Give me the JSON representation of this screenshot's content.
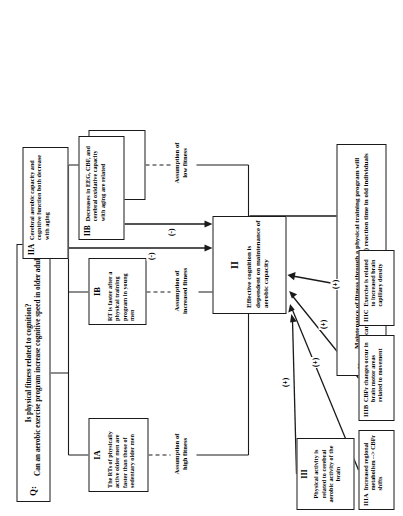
{
  "diagram": {
    "type": "flowchart",
    "orientation": "rotated-90-ccw",
    "title_box": {
      "id": "Q:",
      "text": "Is physical fitness related to cognition?\nCan an aerobic exercise program increase cognitive speed in older adults?"
    },
    "evidence_level_1": [
      {
        "id": "IA",
        "text": "The RTs of physically active older men are faster than those of sedentary older men",
        "assumption": "Assumption of\nhigh fitness"
      },
      {
        "id": "IB",
        "text": "RT is faster after a physical training program in young men",
        "assumption": "Assumption of\nincreased fitness"
      },
      {
        "id": "IC",
        "text": "Persons with CVD have slower RTs",
        "assumption": "Assumption of\nlow fitness"
      }
    ],
    "central_claim": {
      "id": "II",
      "text": "Effective cognition is dependent on maintenance of aerobic capacity"
    },
    "negative_inputs": [
      {
        "id": "IIA",
        "text": "Cerebral aerobic capacity and cognitive function both decrease with aging",
        "sign": "(-)"
      },
      {
        "id": "IIB",
        "text": "Decreases in EEG, CBF, and cerebral oxidative capacity with aging are related",
        "sign": "(-)"
      }
    ],
    "positive_inputs": [
      {
        "id": "III",
        "text": "Physical activity is related to cerebral aerobic activity of the brain",
        "sign": "(+)"
      },
      {
        "id": "IIIA",
        "text": "Increased regional metabolism --> CBFr shifts",
        "sign": "(+)"
      },
      {
        "id": "IIIB",
        "text": "CBFr changes occur in brain motor areas related to movement",
        "sign": "(+)"
      },
      {
        "id": "IIIC",
        "text": "Exercise is related to increased brain capillary density",
        "sign": "(+)"
      }
    ],
    "hypothesis": {
      "id": "H:",
      "text": "Maintenance of fitness through a physical training program will significantly decrease (make faster) reaction time in old individuals"
    },
    "colors": {
      "line": "#1a1a1a",
      "text": "#000000",
      "background": "#ffffff"
    }
  }
}
